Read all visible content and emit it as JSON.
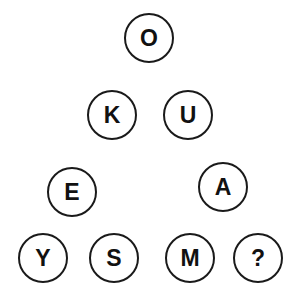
{
  "puzzle": {
    "type": "letter-triangle-puzzle",
    "colors": {
      "background": "#ffffff",
      "circle_stroke": "#1a1a1a",
      "letter": "#111111"
    },
    "nodes": [
      {
        "id": "top",
        "letter": "O",
        "cx": 149,
        "cy": 38
      },
      {
        "id": "row2-left",
        "letter": "K",
        "cx": 112,
        "cy": 115
      },
      {
        "id": "row2-right",
        "letter": "U",
        "cx": 188,
        "cy": 115
      },
      {
        "id": "row3-left",
        "letter": "E",
        "cx": 72,
        "cy": 192
      },
      {
        "id": "row3-right",
        "letter": "A",
        "cx": 223,
        "cy": 187
      },
      {
        "id": "row4-1",
        "letter": "Y",
        "cx": 43,
        "cy": 258
      },
      {
        "id": "row4-2",
        "letter": "S",
        "cx": 114,
        "cy": 258
      },
      {
        "id": "row4-3",
        "letter": "M",
        "cx": 190,
        "cy": 258
      },
      {
        "id": "row4-4",
        "letter": "?",
        "cx": 258,
        "cy": 258
      }
    ]
  }
}
